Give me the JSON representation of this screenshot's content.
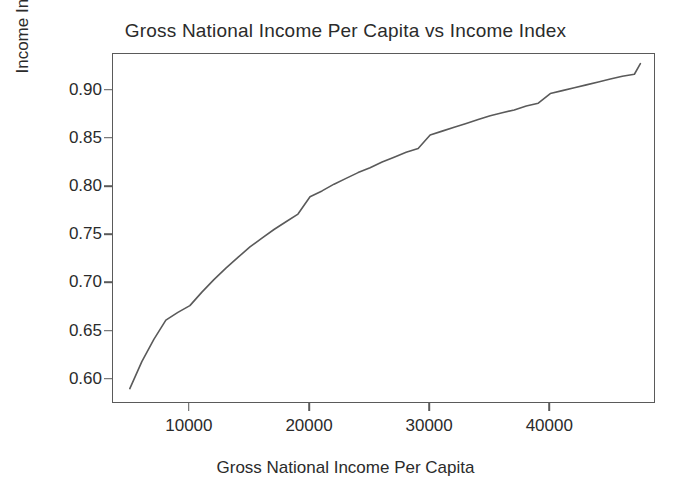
{
  "chart_data": {
    "type": "line",
    "title": "Gross National Income Per Capita vs Income Index",
    "xlabel": "Gross National Income Per Capita",
    "ylabel": "Income Index",
    "xlim": [
      3600,
      48800
    ],
    "ylim": [
      0.575,
      0.938
    ],
    "grid": false,
    "legend": null,
    "line_color": "#5a5a5a",
    "line_width": 1.6,
    "xticks": [
      10000,
      20000,
      30000,
      40000
    ],
    "xtick_labels": [
      "10000",
      "20000",
      "30000",
      "40000"
    ],
    "yticks": [
      0.6,
      0.65,
      0.7,
      0.75,
      0.8,
      0.85,
      0.9
    ],
    "ytick_labels": [
      "0.60",
      "0.65",
      "0.70",
      "0.75",
      "0.80",
      "0.85",
      "0.90"
    ],
    "series": [
      {
        "name": "Income Index",
        "x": [
          5000,
          6000,
          7000,
          8000,
          9000,
          10000,
          11000,
          12000,
          13000,
          14000,
          15000,
          16000,
          17000,
          18000,
          19000,
          20000,
          21000,
          22000,
          23000,
          24000,
          25000,
          26000,
          27000,
          28000,
          29000,
          30000,
          31000,
          32000,
          33000,
          34000,
          35000,
          36000,
          37000,
          38000,
          39000,
          40000,
          41000,
          42000,
          43000,
          44000,
          45000,
          46000,
          47000,
          47500
        ],
        "y": [
          0.591,
          0.619,
          0.642,
          0.662,
          0.67,
          0.677,
          0.691,
          0.704,
          0.716,
          0.727,
          0.738,
          0.747,
          0.756,
          0.764,
          0.772,
          0.79,
          0.796,
          0.803,
          0.809,
          0.815,
          0.82,
          0.826,
          0.831,
          0.836,
          0.84,
          0.854,
          0.858,
          0.862,
          0.866,
          0.87,
          0.874,
          0.877,
          0.88,
          0.884,
          0.887,
          0.897,
          0.9,
          0.903,
          0.906,
          0.909,
          0.912,
          0.915,
          0.917,
          0.928
        ]
      }
    ],
    "annotations": []
  },
  "axes": {
    "title": "Gross National Income Per Capita vs Income Index",
    "x_axis_label": "Gross National Income Per Capita",
    "y_axis_label": "Income Index"
  }
}
